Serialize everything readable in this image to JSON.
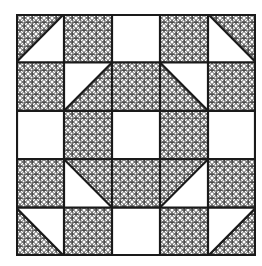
{
  "quilt_block": {
    "rows": 5,
    "cols": 5,
    "colors": {
      "line": "#1a1a1a",
      "fill_plain": "#ffffff",
      "pattern_line": "#333333"
    },
    "legend": {
      "P": "patterned square",
      "W": "white square",
      "T": "half-square triangle"
    },
    "cells": [
      [
        {
          "type": "T",
          "diag": "bl-tr",
          "patterned": "top-left"
        },
        {
          "type": "P"
        },
        {
          "type": "W"
        },
        {
          "type": "P"
        },
        {
          "type": "T",
          "diag": "tl-br",
          "patterned": "top-right"
        }
      ],
      [
        {
          "type": "P"
        },
        {
          "type": "T",
          "diag": "bl-tr",
          "patterned": "bottom-right"
        },
        {
          "type": "P"
        },
        {
          "type": "T",
          "diag": "tl-br",
          "patterned": "bottom-left"
        },
        {
          "type": "P"
        }
      ],
      [
        {
          "type": "W"
        },
        {
          "type": "P"
        },
        {
          "type": "W"
        },
        {
          "type": "P"
        },
        {
          "type": "W"
        }
      ],
      [
        {
          "type": "P"
        },
        {
          "type": "T",
          "diag": "tl-br",
          "patterned": "top-right"
        },
        {
          "type": "P"
        },
        {
          "type": "T",
          "diag": "bl-tr",
          "patterned": "top-left"
        },
        {
          "type": "P"
        }
      ],
      [
        {
          "type": "T",
          "diag": "tl-br",
          "patterned": "bottom-left"
        },
        {
          "type": "P"
        },
        {
          "type": "W"
        },
        {
          "type": "P"
        },
        {
          "type": "T",
          "diag": "bl-tr",
          "patterned": "bottom-right"
        }
      ]
    ]
  }
}
